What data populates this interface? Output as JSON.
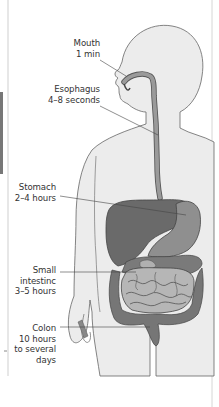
{
  "diagram": {
    "colors": {
      "background": "#ffffff",
      "body_fill": "#ebebeb",
      "outline": "#555555",
      "organ_dark": "#6e6e6e",
      "organ_mid": "#8c8c8c",
      "organ_light": "#b4b4b4",
      "label_text": "#333333"
    },
    "labels": [
      {
        "id": "mouth",
        "organ": "Mouth",
        "time": "1 min"
      },
      {
        "id": "esophagus",
        "organ": "Esophagus",
        "time": "4–8 seconds"
      },
      {
        "id": "stomach",
        "organ": "Stomach",
        "time": "2–4 hours"
      },
      {
        "id": "small_intestine",
        "organ": "Small",
        "organ2": "intestinc",
        "time": "3–5 hours"
      },
      {
        "id": "colon",
        "organ": "Colon",
        "time": "10 hours",
        "time2": "to several",
        "time3": "days"
      }
    ]
  }
}
